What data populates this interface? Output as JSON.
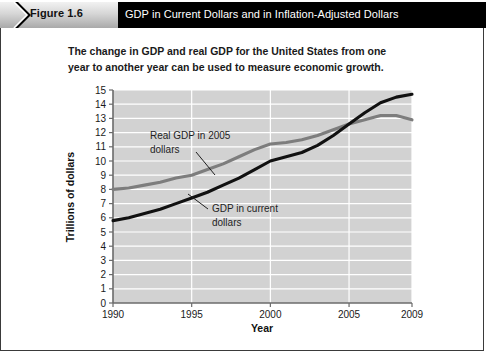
{
  "header": {
    "figure_tag": "Figure 1.6",
    "title": "GDP in Current Dollars and in Inflation-Adjusted Dollars",
    "banner_bg": "#000000",
    "tag_bg": "#c8c8c8",
    "title_color": "#ffffff"
  },
  "caption": "The change in GDP and real GDP for the United States from one year to another year can be used to measure economic growth.",
  "chart_data": {
    "type": "line",
    "title": "",
    "xlabel": "Year",
    "ylabel": "Trillions of dollars",
    "xlim": [
      1990,
      2009
    ],
    "ylim": [
      0,
      15
    ],
    "xticks": [
      1990,
      1995,
      2000,
      2005,
      2009
    ],
    "xtick_labels": [
      "1990",
      "1995",
      "2000",
      "2005",
      "2009"
    ],
    "yticks": [
      0,
      1,
      2,
      3,
      4,
      5,
      6,
      7,
      8,
      9,
      10,
      11,
      12,
      13,
      14,
      15
    ],
    "ytick_labels": [
      "0",
      "1",
      "2",
      "3",
      "4",
      "5",
      "6",
      "7",
      "8",
      "9",
      "10",
      "11",
      "12",
      "13",
      "14",
      "15"
    ],
    "grid": true,
    "grid_color": "#ffffff",
    "plot_bg": "#d2d2d2",
    "legend_position": "annotations-inline",
    "x": [
      1990,
      1991,
      1992,
      1993,
      1994,
      1995,
      1996,
      1997,
      1998,
      1999,
      2000,
      2001,
      2002,
      2003,
      2004,
      2005,
      2006,
      2007,
      2008,
      2009
    ],
    "series": [
      {
        "name": "Real GDP in 2005 dollars",
        "color": "#7d7d7d",
        "values": [
          8.0,
          8.1,
          8.3,
          8.5,
          8.8,
          9.0,
          9.4,
          9.8,
          10.3,
          10.8,
          11.2,
          11.3,
          11.5,
          11.8,
          12.2,
          12.6,
          12.9,
          13.2,
          13.2,
          12.9
        ]
      },
      {
        "name": "GDP in current dollars",
        "color": "#111111",
        "values": [
          5.8,
          6.0,
          6.3,
          6.6,
          7.0,
          7.4,
          7.8,
          8.3,
          8.8,
          9.4,
          10.0,
          10.3,
          10.6,
          11.1,
          11.8,
          12.6,
          13.4,
          14.1,
          14.5,
          14.7
        ]
      }
    ],
    "annotations": [
      {
        "id": "real-gdp-annotation",
        "line1": "Real GDP in 2005",
        "line2": "dollars",
        "text_x": 150,
        "text_y": 139,
        "leader": {
          "x1": 196,
          "y1": 152,
          "x2": 215,
          "y2": 175
        }
      },
      {
        "id": "current-gdp-annotation",
        "line1": "GDP in current",
        "line2": "dollars",
        "text_x": 212,
        "text_y": 212,
        "leader": {
          "x1": 208,
          "y1": 209,
          "x2": 188,
          "y2": 194
        }
      }
    ]
  }
}
